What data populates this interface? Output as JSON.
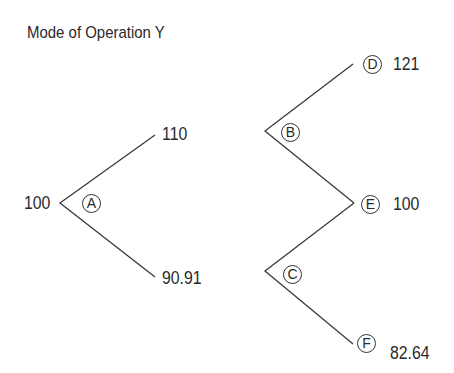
{
  "title": "Mode of Operation Y",
  "nodes": {
    "A": "A",
    "B": "B",
    "C": "C",
    "D": "D",
    "E": "E",
    "F": "F"
  },
  "values": {
    "start": "100",
    "up1": "110",
    "down1": "90.91",
    "D": "121",
    "E": "100",
    "F": "82.64"
  },
  "colors": {
    "line": "#3a3a3a",
    "text": "#2a2a2a",
    "background": "#ffffff"
  }
}
